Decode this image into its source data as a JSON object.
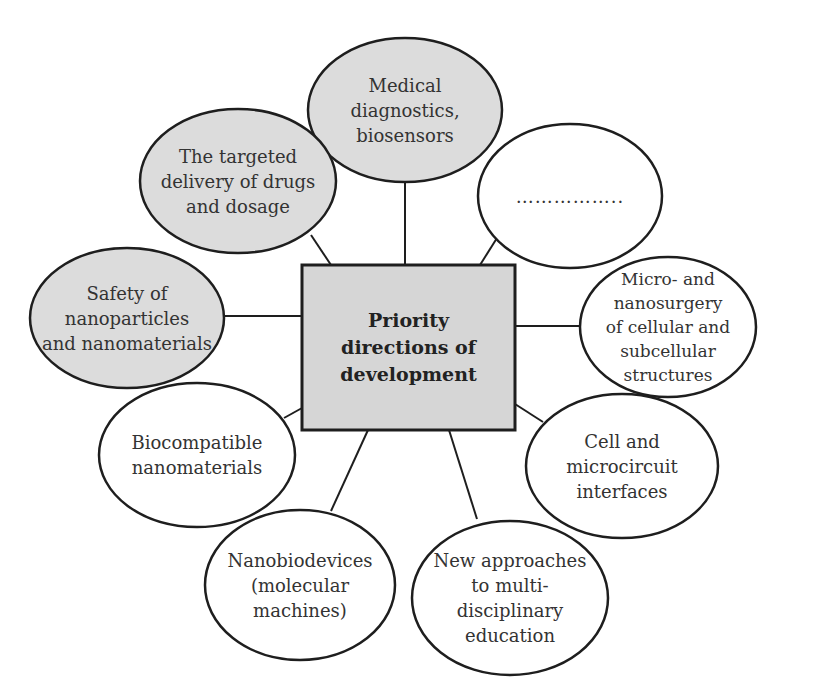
{
  "diagram": {
    "center": {
      "label": "Priority\ndirections of\ndevelopment",
      "fill": "#d6d6d6",
      "x": 302,
      "y": 265,
      "w": 213,
      "h": 165
    },
    "nodes": [
      {
        "id": "medical",
        "label": "Medical\ndiagnostics,\nbiosensors",
        "shaded": true,
        "cx": 405,
        "cy": 110,
        "rx": 97,
        "ry": 72,
        "lx1": 405,
        "ly1": 182,
        "lx2": 405,
        "ly2": 265
      },
      {
        "id": "placeholder",
        "label": "……………..",
        "shaded": false,
        "cx": 570,
        "cy": 196,
        "rx": 92,
        "ry": 72,
        "lx1": 497,
        "ly1": 238,
        "lx2": 480,
        "ly2": 265
      },
      {
        "id": "nanosurgery",
        "label": "Micro- and\nnanosurgery\nof cellular and\nsubcellular\nstructures",
        "shaded": false,
        "cx": 668,
        "cy": 327,
        "rx": 88,
        "ry": 70,
        "lx1": 580,
        "ly1": 326,
        "lx2": 515,
        "ly2": 326
      },
      {
        "id": "cell-interfaces",
        "label": "Cell and\nmicrocircuit\ninterfaces",
        "shaded": false,
        "cx": 622,
        "cy": 466,
        "rx": 96,
        "ry": 72,
        "lx1": 543,
        "ly1": 422,
        "lx2": 515,
        "ly2": 404
      },
      {
        "id": "education",
        "label": "New approaches\nto multi-\ndisciplinary\neducation",
        "shaded": false,
        "cx": 510,
        "cy": 598,
        "rx": 98,
        "ry": 77,
        "lx1": 477,
        "ly1": 519,
        "lx2": 449,
        "ly2": 430
      },
      {
        "id": "nanobiodevices",
        "label": "Nanobiodevices\n(molecular\nmachines)",
        "shaded": false,
        "cx": 300,
        "cy": 585,
        "rx": 95,
        "ry": 75,
        "lx1": 331,
        "ly1": 511,
        "lx2": 368,
        "ly2": 430
      },
      {
        "id": "biocompatible",
        "label": "Biocompatible\nnanomaterials",
        "shaded": false,
        "cx": 197,
        "cy": 455,
        "rx": 98,
        "ry": 72,
        "lx1": 284,
        "ly1": 418,
        "lx2": 302,
        "ly2": 408
      },
      {
        "id": "safety",
        "label": "Safety of\nnanoparticles\nand nanomaterials",
        "shaded": true,
        "cx": 127,
        "cy": 318,
        "rx": 97,
        "ry": 70,
        "lx1": 224,
        "ly1": 316,
        "lx2": 302,
        "ly2": 316
      },
      {
        "id": "targeted-delivery",
        "label": "The targeted\ndelivery of drugs\nand dosage",
        "shaded": true,
        "cx": 238,
        "cy": 181,
        "rx": 98,
        "ry": 72,
        "lx1": 311,
        "ly1": 235,
        "lx2": 331,
        "ly2": 265
      }
    ],
    "colors": {
      "shaded_fill": "#dcdcdc",
      "plain_fill": "#ffffff",
      "stroke": "#1e1e1e"
    }
  }
}
